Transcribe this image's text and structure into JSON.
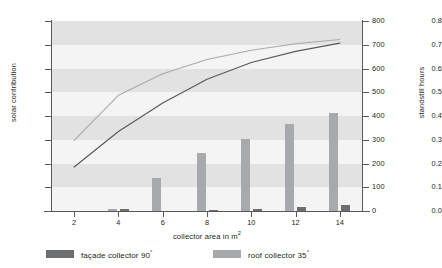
{
  "chart_data": {
    "type": "bar",
    "title": "",
    "xlabel": "collector area in m²",
    "ylabel": "solar contribution",
    "y2label": "standstill hours",
    "categories": [
      2,
      4,
      6,
      8,
      10,
      12,
      14
    ],
    "x": [
      2,
      4,
      6,
      8,
      10,
      12,
      14
    ],
    "xlim": [
      1,
      15
    ],
    "ylim": [
      0.0,
      0.8
    ],
    "y2lim": [
      0,
      800
    ],
    "xticks": [
      "2",
      "4",
      "6",
      "8",
      "10",
      "12",
      "14"
    ],
    "yticks": [
      "0.0",
      "0.1",
      "0.2",
      "0.3",
      "0.4",
      "0.5",
      "0.6",
      "0.7",
      "0.8"
    ],
    "y2ticks": [
      "0",
      "100",
      "200",
      "300",
      "400",
      "500",
      "600",
      "700",
      "800"
    ],
    "grid": "horizontal-bands",
    "legend_position": "below",
    "series": [
      {
        "name": "façade collector 90°",
        "kind": "bar",
        "axis": "right",
        "color": "#6d6e70",
        "values": [
          0,
          10,
          0,
          5,
          10,
          15,
          25
        ]
      },
      {
        "name": "roof collector 35°",
        "kind": "bar",
        "axis": "right",
        "color": "#a7a9ac",
        "values": [
          0,
          8,
          138,
          245,
          305,
          365,
          412
        ]
      },
      {
        "name": "façade collector 90°",
        "kind": "line",
        "axis": "left",
        "color": "#58595b",
        "values": [
          0.185,
          0.335,
          0.455,
          0.555,
          0.625,
          0.672,
          0.707
        ]
      },
      {
        "name": "roof collector 35°",
        "kind": "line",
        "axis": "left",
        "color": "#a7a9ac",
        "values": [
          0.297,
          0.487,
          0.578,
          0.638,
          0.677,
          0.704,
          0.722
        ]
      }
    ]
  },
  "axes": {
    "left_title": "solar contribution",
    "right_title": "standstill hours",
    "bottom_title_text": "collector area in m",
    "bottom_title_sup": "2"
  },
  "legend": {
    "items": [
      {
        "label_text": "façade collector 90",
        "label_sup": "°",
        "color": "#6d6e70"
      },
      {
        "label_text": "roof collector 35",
        "label_sup": "°",
        "color": "#a7a9ac"
      }
    ]
  },
  "colors": {
    "facade": "#6d6e70",
    "roof": "#a7a9ac",
    "facade_line": "#58595b",
    "roof_line": "#a7a9ac",
    "band_dark": "#e2e2e2",
    "band_light": "#f4f4f4",
    "axis": "#58595b",
    "text": "#231f20"
  }
}
